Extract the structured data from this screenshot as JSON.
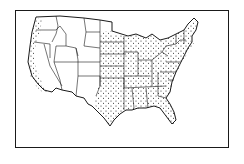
{
  "map": {
    "title": "United States map with stippled regions",
    "subject": "Contiguous United States, state outlines",
    "style": "black line drawing, stipple-dot shading",
    "shaded_regions": [
      {
        "name": "West Coast strip",
        "states": [
          "Washington (western)",
          "Oregon (western)",
          "California (coastal)"
        ]
      },
      {
        "name": "Eastern United States",
        "states": [
          "North Dakota (eastern)",
          "South Dakota (eastern)",
          "Nebraska (eastern)",
          "Kansas",
          "Oklahoma",
          "Texas (central/eastern)",
          "Minnesota",
          "Iowa",
          "Missouri",
          "Arkansas",
          "Louisiana",
          "Wisconsin",
          "Illinois",
          "Michigan",
          "Indiana",
          "Ohio",
          "Kentucky",
          "Tennessee",
          "Mississippi",
          "Alabama",
          "Georgia",
          "Florida",
          "South Carolina",
          "North Carolina",
          "Virginia",
          "West Virginia",
          "Pennsylvania",
          "New York",
          "New Jersey",
          "Delaware",
          "Maryland",
          "Connecticut",
          "Rhode Island",
          "Massachusetts",
          "Vermont",
          "New Hampshire",
          "Maine"
        ]
      }
    ],
    "unshaded_region": "Interior West (Mountain and Great Basin states)",
    "colors": {
      "line": "#1a1a1a",
      "fill": "#ffffff",
      "stipple": "#222222"
    }
  }
}
